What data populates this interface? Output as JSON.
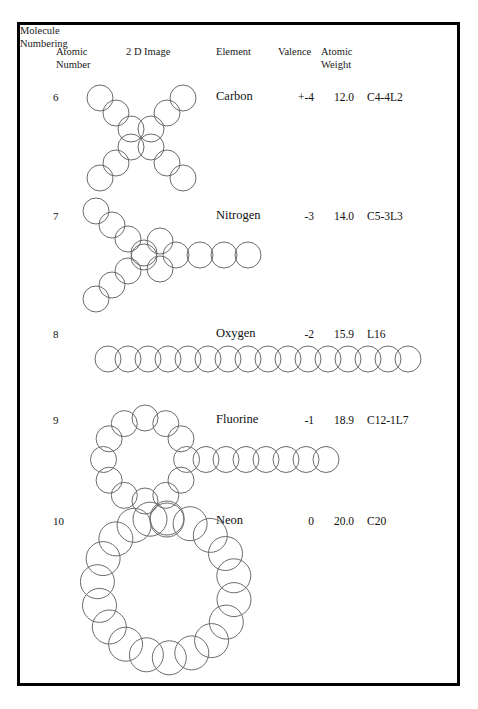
{
  "page": {
    "border_color": "#000000",
    "background_color": "#ffffff",
    "circle_stroke_color": "#6b6b6b"
  },
  "table": {
    "headers": {
      "atomic_number": "Atomic\nNumber",
      "image": "2 D Image",
      "element": "Element",
      "valence": "Valence",
      "atomic_weight": "Atomic\nWeight",
      "molecule_numbering": "Molecule\nNumbering"
    },
    "rows": [
      {
        "atomic_number": "6",
        "element": "Carbon",
        "valence": "+-4",
        "atomic_weight": "12.0",
        "molecule_numbering": "C4-4L2",
        "shape": "x-cross",
        "circle_count": 12
      },
      {
        "atomic_number": "7",
        "element": "Nitrogen",
        "valence": "-3",
        "atomic_weight": "14.0",
        "molecule_numbering": "C5-3L3",
        "shape": "y-branch",
        "circle_count": 14
      },
      {
        "atomic_number": "8",
        "element": "Oxygen",
        "valence": "-2",
        "atomic_weight": "15.9",
        "molecule_numbering": "L16",
        "shape": "linear-chain",
        "circle_count": 16
      },
      {
        "atomic_number": "9",
        "element": "Fluorine",
        "valence": "-1",
        "atomic_weight": "18.9",
        "molecule_numbering": "C12-1L7",
        "shape": "ring-with-tail",
        "ring_count": 12,
        "tail_count": 7
      },
      {
        "atomic_number": "10",
        "element": "Neon",
        "valence": "0",
        "atomic_weight": "20.0",
        "molecule_numbering": "C20",
        "shape": "ring",
        "ring_count": 20
      }
    ]
  }
}
